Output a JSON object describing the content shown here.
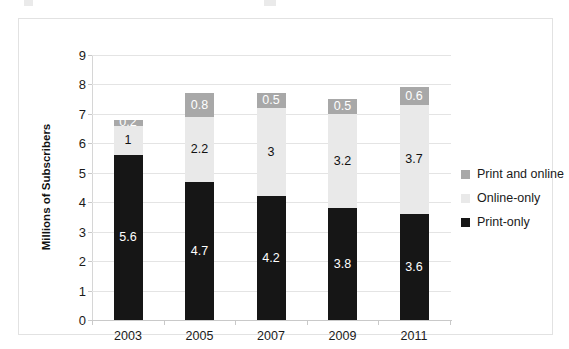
{
  "chart_data": {
    "type": "bar",
    "subtype": "stacked-column",
    "title": "",
    "xlabel": "",
    "ylabel": "Millions of Subscribers",
    "categories": [
      "2003",
      "2005",
      "2007",
      "2009",
      "2011"
    ],
    "ylim": [
      0,
      9
    ],
    "yticks": [
      "0",
      "1",
      "2",
      "3",
      "4",
      "5",
      "6",
      "7",
      "8",
      "9"
    ],
    "ytick_values": [
      0,
      1,
      2,
      3,
      4,
      5,
      6,
      7,
      8,
      9
    ],
    "grid": true,
    "legend_position": "right",
    "series": [
      {
        "name": "Print-only",
        "color": "#161616",
        "values": [
          5.6,
          4.7,
          4.2,
          3.8,
          3.6
        ],
        "labels": [
          "5.6",
          "4.7",
          "4.2",
          "3.8",
          "3.6"
        ]
      },
      {
        "name": "Online-only",
        "color": "#e9e9e9",
        "values": [
          1,
          2.2,
          3,
          3.2,
          3.7
        ],
        "labels": [
          "1",
          "2.2",
          "3",
          "3.2",
          "3.7"
        ]
      },
      {
        "name": "Print and online",
        "color": "#a8a8a8",
        "values": [
          0.2,
          0.8,
          0.5,
          0.5,
          0.6
        ],
        "labels": [
          "0.2",
          "0.8",
          "0.5",
          "0.5",
          "0.6"
        ]
      }
    ],
    "stack_totals": [
      6.8,
      7.7,
      7.7,
      7.5,
      7.9
    ]
  },
  "legend": {
    "items": [
      {
        "label": "Print and online",
        "color": "#a8a8a8"
      },
      {
        "label": "Online-only",
        "color": "#e9e9e9"
      },
      {
        "label": "Print-only",
        "color": "#161616"
      }
    ]
  }
}
